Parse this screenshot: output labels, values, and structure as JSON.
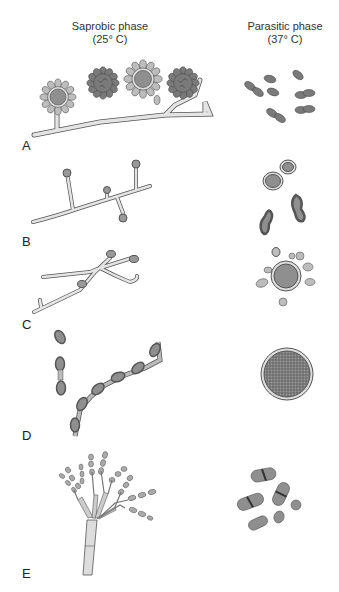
{
  "headers": {
    "saprobic": {
      "title": "Saprobic phase",
      "temp": "(25° C)"
    },
    "parasitic": {
      "title": "Parasitic phase",
      "temp": "(37° C)"
    }
  },
  "rows": [
    {
      "label": "A"
    },
    {
      "label": "B"
    },
    {
      "label": "C"
    },
    {
      "label": "D"
    },
    {
      "label": "E"
    }
  ],
  "colors": {
    "fill_light": "#bdbdbd",
    "fill_mid": "#8f8f8f",
    "fill_dark": "#6e6e6e",
    "outline": "#4a4a4a",
    "hypha": "#e4e4e4"
  }
}
